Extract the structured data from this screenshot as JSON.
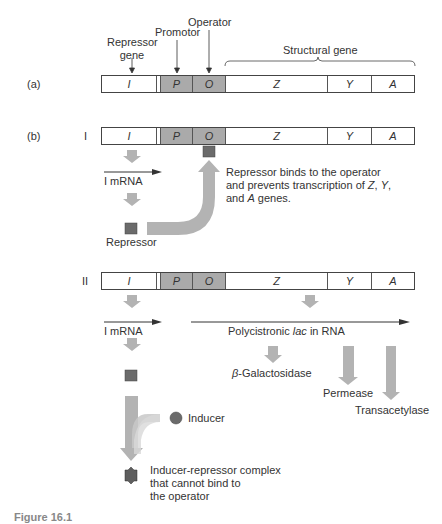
{
  "header_labels": {
    "repressor_gene": [
      "Repressor",
      "gene"
    ],
    "promotor": "Promotor",
    "operator": "Operator",
    "structural_gene": "Structural gene"
  },
  "panels": {
    "a_label": "(a)",
    "b_label": "(b)",
    "b_I_label": "I",
    "b_II_label": "II"
  },
  "gene_segments": [
    {
      "id": "I",
      "label": "I",
      "shaded": false
    },
    {
      "id": "P",
      "label": "P",
      "shaded": true
    },
    {
      "id": "O",
      "label": "O",
      "shaded": true
    },
    {
      "id": "Z",
      "label": "Z",
      "shaded": false
    },
    {
      "id": "Y",
      "label": "Y",
      "shaded": false
    },
    {
      "id": "A",
      "label": "A",
      "shaded": false
    }
  ],
  "panel_I": {
    "mrna_label": "I mRNA",
    "repressor_label": "Repressor",
    "note_lines": [
      "Repressor binds to the operator",
      "and prevents transcription of Z, Y,",
      "and A genes."
    ]
  },
  "panel_II": {
    "mrna_label": "I mRNA",
    "poly_prefix": "Polycistronic ",
    "poly_italic": "lac",
    "poly_suffix": " in RNA",
    "beta_symbol": "β",
    "beta_rest": "-Galactosidase",
    "permease": "Permease",
    "transacetylase": "Transacetylase",
    "inducer": "Inducer",
    "complex_lines": [
      "Inducer-repressor complex",
      "that cannot bind to",
      "the operator"
    ]
  },
  "caption_partial": "Figure 16.1",
  "colors": {
    "shade": "#aaaaaa",
    "arrow": "#b3b3b3",
    "repressor": "#6b6b6b",
    "line": "#333333"
  }
}
